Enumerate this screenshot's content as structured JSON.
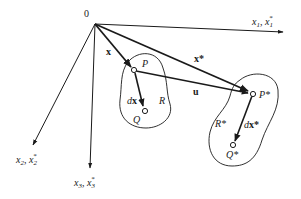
{
  "diagram": {
    "origin_label": "0",
    "axes": {
      "x1": {
        "main": "x",
        "sub": "1",
        "sep": ", ",
        "star_main": "x",
        "star_sub": "1",
        "star_sup": "*"
      },
      "x2": {
        "main": "x",
        "sub": "2",
        "sep": ", ",
        "star_main": "x",
        "star_sub": "2",
        "star_sup": "*"
      },
      "x3": {
        "main": "x",
        "sub": "3",
        "sep": ", ",
        "star_main": "x",
        "star_sub": "3",
        "star_sup": "*"
      }
    },
    "vectors": {
      "x": "x",
      "x_star": "x*",
      "u": "u",
      "dx_d": "d",
      "dx_x": "x",
      "dx_star_d": "d",
      "dx_star_x": "x*"
    },
    "points": {
      "P": "P",
      "Q": "Q",
      "P_star": "P*",
      "Q_star": "Q*"
    },
    "regions": {
      "R": "R",
      "R_star": "R*"
    },
    "colors": {
      "ink": "#1a1a1a",
      "background": "#ffffff"
    }
  }
}
